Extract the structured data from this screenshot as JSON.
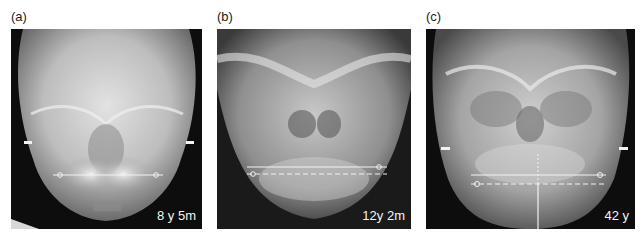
{
  "figure": {
    "panels": [
      {
        "id": "a",
        "label": "(a)",
        "age_label": "8 y 5m",
        "description": "Posteroanterior cephalometric radiograph of a child skull",
        "markers": {
          "side_ticks": 2,
          "solid_line": true,
          "dashed_line": false,
          "vertical_midline": false
        }
      },
      {
        "id": "b",
        "label": "(b)",
        "age_label": "12y 2m",
        "description": "Posteroanterior cephalometric radiograph of an adolescent skull",
        "markers": {
          "side_ticks": 0,
          "solid_line": true,
          "dashed_line": true,
          "vertical_midline": false
        }
      },
      {
        "id": "c",
        "label": "(c)",
        "age_label": "42 y",
        "description": "Posteroanterior cephalometric radiograph of an adult skull",
        "markers": {
          "side_ticks": 2,
          "solid_line": true,
          "dashed_line": true,
          "vertical_midline": true
        }
      }
    ],
    "colors": {
      "background": "#ffffff",
      "film": "#0d0d0d",
      "bone": "#d8d8d8",
      "overlay": "#f2f2f2",
      "label_text": "#222222"
    }
  }
}
